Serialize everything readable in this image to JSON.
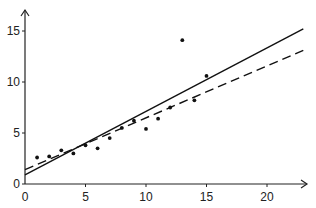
{
  "chart_data": {
    "type": "scatter",
    "title": "",
    "xlabel": "",
    "ylabel": "",
    "xlim": [
      0,
      23
    ],
    "ylim": [
      0,
      17
    ],
    "grid": false,
    "legend": null,
    "x_ticks": [
      0,
      5,
      10,
      15,
      20
    ],
    "y_ticks": [
      0,
      5,
      10,
      15
    ],
    "x_tick_labels": [
      "0",
      "5",
      "10",
      "15",
      "20"
    ],
    "y_tick_labels": [
      "0",
      "5",
      "10",
      "15"
    ],
    "series": [
      {
        "name": "observations",
        "kind": "points",
        "x": [
          1,
          2,
          3,
          4,
          5,
          6,
          7,
          8,
          9,
          10,
          11,
          12,
          13,
          14,
          15
        ],
        "y": [
          2.6,
          2.7,
          3.3,
          3.0,
          3.8,
          3.5,
          4.5,
          5.5,
          6.2,
          5.4,
          6.4,
          7.5,
          14.1,
          8.2,
          10.6
        ]
      },
      {
        "name": "fit-solid",
        "kind": "line",
        "style": "solid",
        "x": [
          0,
          23
        ],
        "y": [
          0.9,
          15.2
        ]
      },
      {
        "name": "fit-dashed",
        "kind": "line",
        "style": "dashed",
        "x": [
          0,
          23
        ],
        "y": [
          1.4,
          13.1
        ]
      }
    ],
    "colors": {
      "axis": "#222222",
      "points": "#111111",
      "lines": "#111111"
    }
  }
}
